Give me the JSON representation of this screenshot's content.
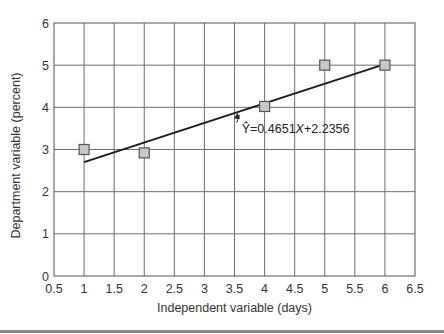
{
  "chart_data": {
    "type": "scatter",
    "title": "",
    "xlabel": "Independent variable (days)",
    "ylabel": "Department variable (percent)",
    "xlim": [
      0.5,
      6.5
    ],
    "ylim": [
      0,
      6
    ],
    "x_ticks": [
      "0.5",
      "1",
      "1.5",
      "2",
      "2.5",
      "3",
      "3.5",
      "4",
      "4.5",
      "5",
      "5.5",
      "6",
      "6.5"
    ],
    "y_ticks": [
      "0",
      "1",
      "2",
      "3",
      "4",
      "5",
      "6"
    ],
    "grid": true,
    "legend": null,
    "series": [
      {
        "name": "Observed",
        "type": "scatter",
        "marker": "square",
        "x": [
          1,
          2,
          4,
          5,
          6
        ],
        "y": [
          3.0,
          2.92,
          4.02,
          5.0,
          5.0
        ]
      },
      {
        "name": "Regression line",
        "type": "line",
        "x": [
          1,
          6
        ],
        "y": [
          2.7007,
          5.0262
        ],
        "slope": 0.4651,
        "intercept": 2.2356
      }
    ],
    "annotations": [
      {
        "text_prefix": "Ŷ",
        "text": "=0.4651X+2.2356",
        "x": 3.62,
        "y": 3.4,
        "arrow_to": [
          3.55,
          3.87
        ]
      }
    ]
  },
  "labels": {
    "xlabel": "Independent variable (days)",
    "ylabel": "Department variable (percent)",
    "equation_lhs": "Ŷ",
    "equation_eq": "=0.4651",
    "equation_x": "X",
    "equation_rest": "+2.2356"
  },
  "colors": {
    "grid": "#6e6e6e",
    "axis": "#555555",
    "line": "#1a1a1a",
    "marker_fill": "#c8c8c8",
    "marker_stroke": "#555555",
    "rule": "#8a8a8a"
  }
}
